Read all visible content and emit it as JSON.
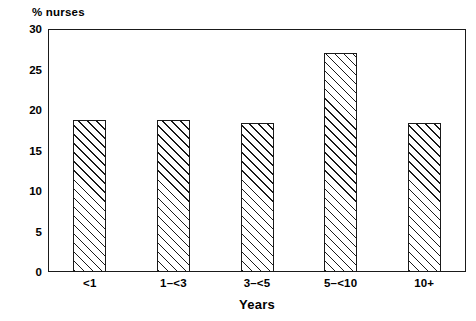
{
  "chart_data": {
    "type": "bar",
    "title": "% nurses",
    "xlabel": "Years",
    "ylabel": "",
    "categories": [
      "<1",
      "1–<3",
      "3–<5",
      "5–<10",
      "10+"
    ],
    "values": [
      18.8,
      18.8,
      18.4,
      27.0,
      18.4
    ],
    "ylim": [
      0,
      30
    ],
    "yticks": [
      0,
      5,
      10,
      15,
      20,
      25,
      30
    ],
    "ytick_labels": [
      "0",
      "5",
      "10",
      "15",
      "20",
      "25",
      "30"
    ],
    "grid": false,
    "legend": null,
    "bar_style": {
      "fill": "#ffffff",
      "edge": "#1a1a1a",
      "hatch": "forward-diagonal"
    },
    "frame": {
      "color": "#1a1a1a",
      "box": true
    }
  }
}
